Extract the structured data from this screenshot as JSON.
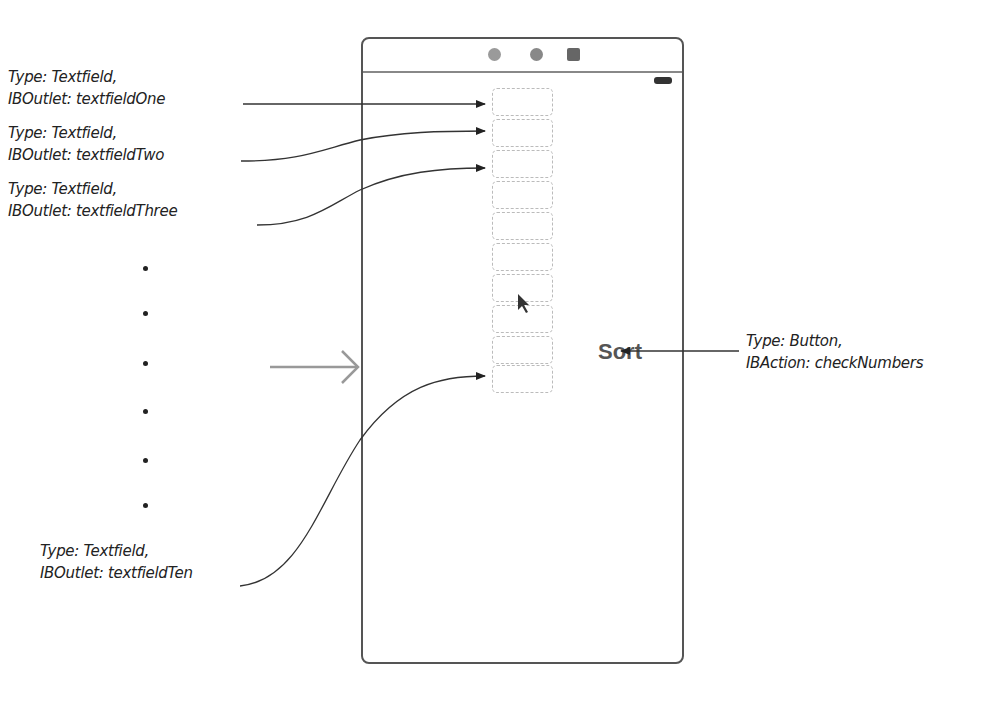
{
  "annotations": {
    "tf_one": {
      "type": "Type: Textfield,",
      "outlet": "IBOutlet: textfieldOne"
    },
    "tf_two": {
      "type": "Type: Textfield,",
      "outlet": "IBOutlet: textfieldTwo"
    },
    "tf_three": {
      "type": "Type: Textfield,",
      "outlet": "IBOutlet: textfieldThree"
    },
    "tf_ten": {
      "type": "Type: Textfield,",
      "outlet": "IBOutlet: textfieldTen"
    },
    "button": {
      "type": "Type: Button,",
      "action": "IBAction: checkNumbers"
    }
  },
  "device": {
    "top_icons": [
      "view-controller-icon",
      "first-responder-icon",
      "exit-icon"
    ],
    "battery": "battery-icon",
    "textfield_count": 10,
    "sort_button_label": "Sort"
  },
  "ellipsis_dots": 6,
  "colors": {
    "line": "#333333",
    "device_border": "#555555",
    "sort_text": "#555555",
    "entry_arrow": "#999999"
  }
}
